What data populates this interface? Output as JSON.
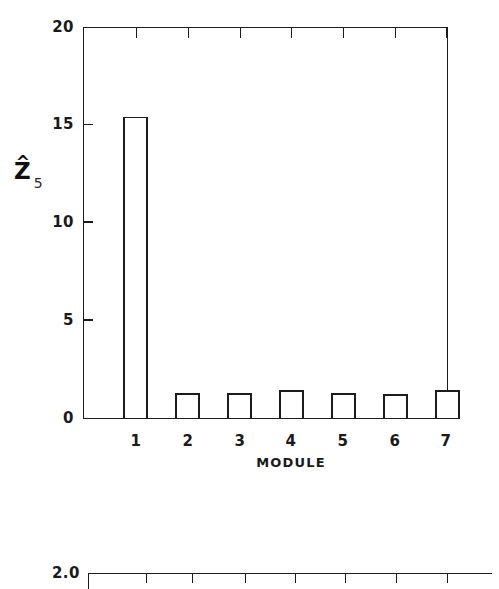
{
  "chart_data": [
    {
      "id": "module-bar-chart",
      "type": "bar",
      "title": "",
      "xlabel": "MODULE",
      "ylabel": "Z",
      "ylabel_accent": "^",
      "ylabel_subscript": "5",
      "categories": [
        "1",
        "2",
        "3",
        "4",
        "5",
        "6",
        "7"
      ],
      "values": [
        15.4,
        1.25,
        1.25,
        1.4,
        1.25,
        1.2,
        1.4
      ],
      "ylim": [
        0,
        20
      ],
      "yticks": [
        0,
        5,
        10,
        15,
        20
      ],
      "ytick_labels": [
        "0",
        "5",
        "10",
        "15",
        "20"
      ],
      "xtick_labels": [
        "1",
        "2",
        "3",
        "4",
        "5",
        "6",
        "7"
      ],
      "grid": false,
      "legend": "none",
      "bar_fill": "#ffffff",
      "bar_edge": "#1c1c1c",
      "frame": "box"
    },
    {
      "id": "lower-partial-chart",
      "type": "line",
      "title": "",
      "xlabel": "",
      "ylabel": "",
      "ylim": [
        null,
        2.0
      ],
      "yticks": [
        2.0
      ],
      "ytick_labels": [
        "2.0"
      ],
      "xtick_count": 7,
      "grid": false,
      "legend": "none",
      "note": "only the top axis line of a second panel is visible"
    }
  ],
  "axis": {
    "y_labels": [
      "20",
      "15",
      "10",
      "5",
      "0"
    ],
    "x_labels": [
      "1",
      "2",
      "3",
      "4",
      "5",
      "6",
      "7"
    ],
    "x_title": "MODULE",
    "y_symbol": "Z",
    "y_hat": "^",
    "y_subscript": "5"
  },
  "lower_axis": {
    "y_labels": [
      "2.0"
    ]
  },
  "colors": {
    "ink": "#1c1c1c",
    "background": "#ffffff",
    "bar_fill": "#ffffff"
  }
}
